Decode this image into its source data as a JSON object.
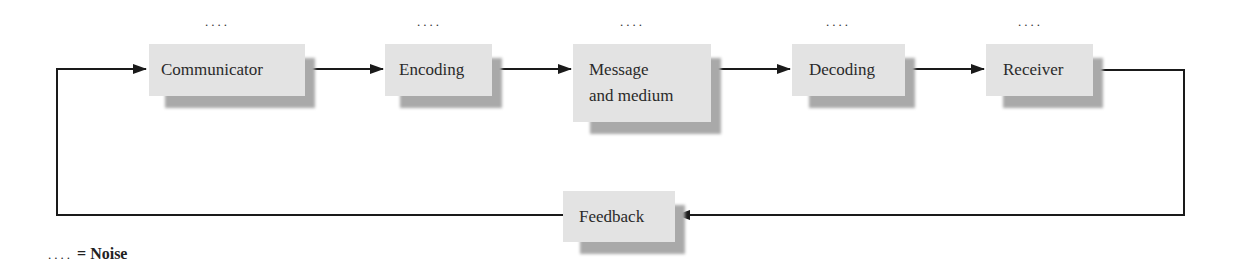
{
  "diagram": {
    "type": "flowchart",
    "nodes": [
      {
        "id": "communicator",
        "label": "Communicator",
        "noise": "...."
      },
      {
        "id": "encoding",
        "label": "Encoding",
        "noise": "...."
      },
      {
        "id": "message",
        "label_line1": "Message",
        "label_line2": "and medium",
        "noise": "...."
      },
      {
        "id": "decoding",
        "label": "Decoding",
        "noise": "...."
      },
      {
        "id": "receiver",
        "label": "Receiver",
        "noise": "...."
      },
      {
        "id": "feedback",
        "label": "Feedback"
      }
    ],
    "edges": [
      {
        "from": "communicator",
        "to": "encoding"
      },
      {
        "from": "encoding",
        "to": "message"
      },
      {
        "from": "message",
        "to": "decoding"
      },
      {
        "from": "decoding",
        "to": "receiver"
      },
      {
        "from": "receiver",
        "to": "feedback"
      },
      {
        "from": "feedback",
        "to": "communicator"
      }
    ],
    "colors": {
      "box_fill": "#e3e3e3",
      "shadow": "#a9a9a9",
      "line": "#1a1a1a"
    }
  },
  "legend": {
    "dots": "....",
    "equals": "=",
    "label": "Noise"
  }
}
